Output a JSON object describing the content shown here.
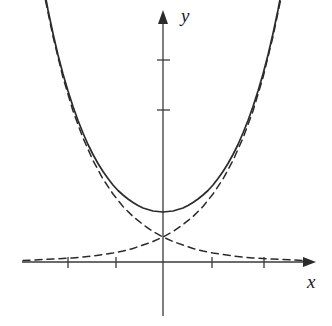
{
  "figure": {
    "kind": "mathematical-plot",
    "background_color": "#ffffff",
    "ink_color": "#2b2b2b"
  },
  "axes": {
    "x_label": "x",
    "y_label": "y",
    "origin_px": [
      163,
      262
    ],
    "unit_px": 50,
    "x_axis_y_px": 262,
    "y_axis_x_px": 163,
    "x_range_px": [
      22,
      316
    ],
    "y_range_px": [
      10,
      316
    ],
    "x_ticks_px": [
      68,
      116,
      212,
      264
    ],
    "y_ticks_px": [
      60,
      110
    ],
    "x_tick_values": [
      -2,
      -1,
      1,
      2
    ],
    "y_tick_values": [
      3,
      4
    ],
    "tick_half_len_px": 5,
    "arrowheads": [
      "x-positive",
      "y-positive"
    ],
    "tick_labels_shown": false,
    "grid": false
  },
  "chart_data": {
    "type": "line",
    "title": "",
    "xlabel": "x",
    "ylabel": "y",
    "xlim": [
      -2.8,
      3.1
    ],
    "ylim": [
      -1.0,
      5.05
    ],
    "grid": false,
    "legend": "none",
    "xticks": [
      -2,
      -1,
      1,
      2
    ],
    "yticks": [
      3,
      4
    ],
    "series": [
      {
        "name": "cosh(x)",
        "style": "solid",
        "color": "#2b2b2b",
        "width_px": 1.7,
        "x": [
          -2.42,
          -2.3,
          -2.2,
          -2.1,
          -2.0,
          -1.9,
          -1.8,
          -1.7,
          -1.6,
          -1.5,
          -1.4,
          -1.3,
          -1.2,
          -1.1,
          -1.0,
          -0.9,
          -0.8,
          -0.7,
          -0.6,
          -0.5,
          -0.4,
          -0.3,
          -0.2,
          -0.1,
          0.0,
          0.1,
          0.2,
          0.3,
          0.4,
          0.5,
          0.6,
          0.7,
          0.8,
          0.9,
          1.0,
          1.1,
          1.2,
          1.3,
          1.4,
          1.5,
          1.6,
          1.7,
          1.8,
          1.9,
          2.0,
          2.1,
          2.2,
          2.3,
          2.42
        ],
        "y": [
          5.68,
          5.04,
          4.57,
          4.14,
          3.76,
          3.42,
          3.11,
          2.83,
          2.58,
          2.35,
          2.15,
          1.97,
          1.81,
          1.67,
          1.54,
          1.43,
          1.34,
          1.26,
          1.19,
          1.13,
          1.08,
          1.05,
          1.02,
          1.01,
          1.0,
          1.01,
          1.02,
          1.05,
          1.08,
          1.13,
          1.19,
          1.26,
          1.34,
          1.43,
          1.54,
          1.67,
          1.81,
          1.97,
          2.15,
          2.35,
          2.58,
          2.83,
          3.11,
          3.42,
          3.76,
          4.14,
          4.57,
          5.04,
          5.68
        ]
      },
      {
        "name": "e^x/2",
        "style": "dashed",
        "color": "#2b2b2b",
        "width_px": 1.5,
        "x": [
          -2.8,
          -2.6,
          -2.4,
          -2.2,
          -2.0,
          -1.8,
          -1.6,
          -1.4,
          -1.2,
          -1.0,
          -0.8,
          -0.6,
          -0.4,
          -0.2,
          0.0,
          0.2,
          0.4,
          0.6,
          0.8,
          1.0,
          1.2,
          1.4,
          1.6,
          1.8,
          2.0,
          2.2,
          2.35
        ],
        "y": [
          0.03,
          0.04,
          0.05,
          0.06,
          0.07,
          0.08,
          0.1,
          0.12,
          0.15,
          0.18,
          0.22,
          0.27,
          0.34,
          0.41,
          0.5,
          0.61,
          0.75,
          0.91,
          1.11,
          1.36,
          1.66,
          2.03,
          2.48,
          3.02,
          3.69,
          4.51,
          5.23
        ]
      },
      {
        "name": "e^-x/2",
        "style": "dashed",
        "color": "#2b2b2b",
        "width_px": 1.5,
        "x": [
          -2.35,
          -2.2,
          -2.0,
          -1.8,
          -1.6,
          -1.4,
          -1.2,
          -1.0,
          -0.8,
          -0.6,
          -0.4,
          -0.2,
          0.0,
          0.2,
          0.4,
          0.6,
          0.8,
          1.0,
          1.2,
          1.4,
          1.6,
          1.8,
          2.0,
          2.2,
          2.4,
          2.6,
          2.8
        ],
        "y": [
          5.23,
          4.51,
          3.69,
          3.02,
          2.48,
          2.03,
          1.66,
          1.36,
          1.11,
          0.91,
          0.75,
          0.61,
          0.5,
          0.41,
          0.34,
          0.27,
          0.22,
          0.18,
          0.15,
          0.12,
          0.1,
          0.08,
          0.07,
          0.06,
          0.05,
          0.04,
          0.03
        ]
      }
    ],
    "annotations": [
      {
        "name": "curves-intersection",
        "x": 0,
        "y": 0.5
      },
      {
        "name": "cosh-minimum",
        "x": 0,
        "y": 1.0
      }
    ]
  }
}
